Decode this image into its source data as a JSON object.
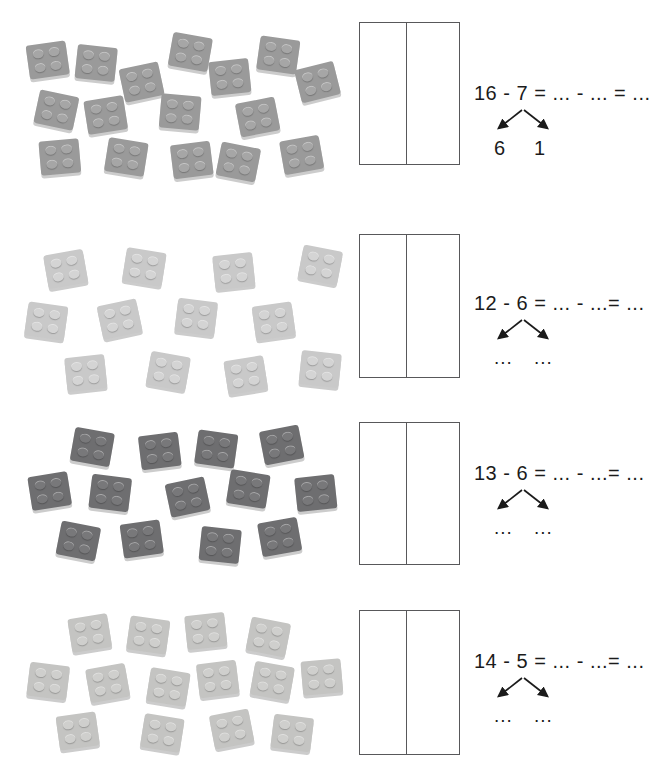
{
  "page": {
    "background_color": "#ffffff"
  },
  "rows": [
    {
      "id": "row-1",
      "brick_count": 16,
      "brick_color": "#9a9a9a",
      "brick_stud_color": "#a6a6a6",
      "equation": "16 - 7 = ... - ... = ...",
      "minuend": "16",
      "subtrahend": "7",
      "bond_left": "6",
      "bond_right": "1",
      "box_filled": false
    },
    {
      "id": "row-2",
      "brick_count": 12,
      "brick_color": "#c9c9c9",
      "brick_stud_color": "#d4d4d4",
      "equation": "12 - 6 = ... - ...= ...",
      "minuend": "12",
      "subtrahend": "6",
      "bond_left": "...",
      "bond_right": "...",
      "box_filled": false
    },
    {
      "id": "row-3",
      "brick_count": 13,
      "brick_color": "#6e6e70",
      "brick_stud_color": "#78787a",
      "equation": "13 - 6 = ... - ...= ...",
      "minuend": "13",
      "subtrahend": "6",
      "bond_left": "...",
      "bond_right": "...",
      "box_filled": false
    },
    {
      "id": "row-4",
      "brick_count": 14,
      "brick_color": "#c4c4c2",
      "brick_stud_color": "#cfcfcd",
      "equation": "14 - 5 = ... - ...= ...",
      "minuend": "14",
      "subtrahend": "5",
      "bond_left": "...",
      "bond_right": "...",
      "box_filled": false
    }
  ],
  "brick_layouts": {
    "row-1": [
      {
        "x": 28,
        "y": 33,
        "r": -8
      },
      {
        "x": 76,
        "y": 36,
        "r": 6
      },
      {
        "x": 122,
        "y": 55,
        "r": -12
      },
      {
        "x": 170,
        "y": 25,
        "r": 10
      },
      {
        "x": 210,
        "y": 50,
        "r": -6
      },
      {
        "x": 258,
        "y": 28,
        "r": 8
      },
      {
        "x": 298,
        "y": 55,
        "r": -14
      },
      {
        "x": 36,
        "y": 83,
        "r": 12
      },
      {
        "x": 86,
        "y": 88,
        "r": -9
      },
      {
        "x": 160,
        "y": 85,
        "r": 5
      },
      {
        "x": 238,
        "y": 90,
        "r": -11
      },
      {
        "x": 40,
        "y": 130,
        "r": -5
      },
      {
        "x": 106,
        "y": 130,
        "r": 9
      },
      {
        "x": 172,
        "y": 133,
        "r": -7
      },
      {
        "x": 218,
        "y": 135,
        "r": 11
      },
      {
        "x": 282,
        "y": 128,
        "r": -10
      }
    ],
    "row-2": [
      {
        "x": 46,
        "y": 30,
        "r": -10
      },
      {
        "x": 124,
        "y": 28,
        "r": 9
      },
      {
        "x": 214,
        "y": 32,
        "r": -6
      },
      {
        "x": 300,
        "y": 26,
        "r": 11
      },
      {
        "x": 26,
        "y": 82,
        "r": 8
      },
      {
        "x": 100,
        "y": 80,
        "r": -12
      },
      {
        "x": 176,
        "y": 78,
        "r": 7
      },
      {
        "x": 254,
        "y": 82,
        "r": -8
      },
      {
        "x": 66,
        "y": 134,
        "r": -6
      },
      {
        "x": 148,
        "y": 132,
        "r": 10
      },
      {
        "x": 226,
        "y": 136,
        "r": -9
      },
      {
        "x": 300,
        "y": 130,
        "r": 6
      }
    ],
    "row-3": [
      {
        "x": 72,
        "y": 20,
        "r": 10
      },
      {
        "x": 140,
        "y": 24,
        "r": -7
      },
      {
        "x": 196,
        "y": 22,
        "r": 8
      },
      {
        "x": 262,
        "y": 18,
        "r": -11
      },
      {
        "x": 30,
        "y": 64,
        "r": -9
      },
      {
        "x": 90,
        "y": 66,
        "r": 7
      },
      {
        "x": 168,
        "y": 70,
        "r": -12
      },
      {
        "x": 228,
        "y": 62,
        "r": 9
      },
      {
        "x": 296,
        "y": 66,
        "r": -6
      },
      {
        "x": 58,
        "y": 114,
        "r": 11
      },
      {
        "x": 122,
        "y": 112,
        "r": -8
      },
      {
        "x": 200,
        "y": 118,
        "r": 6
      },
      {
        "x": 260,
        "y": 110,
        "r": -10
      }
    ],
    "row-4": [
      {
        "x": 70,
        "y": 18,
        "r": -9
      },
      {
        "x": 128,
        "y": 20,
        "r": 8
      },
      {
        "x": 186,
        "y": 16,
        "r": -6
      },
      {
        "x": 248,
        "y": 22,
        "r": 11
      },
      {
        "x": 28,
        "y": 66,
        "r": 7
      },
      {
        "x": 88,
        "y": 68,
        "r": -10
      },
      {
        "x": 148,
        "y": 72,
        "r": 9
      },
      {
        "x": 198,
        "y": 64,
        "r": -7
      },
      {
        "x": 252,
        "y": 66,
        "r": 10
      },
      {
        "x": 302,
        "y": 62,
        "r": -5
      },
      {
        "x": 58,
        "y": 116,
        "r": -8
      },
      {
        "x": 142,
        "y": 118,
        "r": 9
      },
      {
        "x": 212,
        "y": 114,
        "r": -11
      },
      {
        "x": 272,
        "y": 118,
        "r": 7
      }
    ]
  },
  "boxes": [
    {
      "id": "answer-box-1",
      "left": 359,
      "top": 22,
      "width": 101,
      "height": 143,
      "divider_offset": 46
    },
    {
      "id": "answer-box-2",
      "left": 359,
      "top": 234,
      "width": 101,
      "height": 144,
      "divider_offset": 46
    },
    {
      "id": "answer-box-3",
      "left": 359,
      "top": 422,
      "width": 101,
      "height": 143,
      "divider_offset": 46
    },
    {
      "id": "answer-box-4",
      "left": 359,
      "top": 610,
      "width": 101,
      "height": 145,
      "divider_offset": 46
    }
  ],
  "row_positions": [
    {
      "top": 10,
      "eq_left": 474,
      "eq_top": 82
    },
    {
      "top": 222,
      "eq_left": 474,
      "eq_top": 292
    },
    {
      "top": 410,
      "eq_left": 474,
      "eq_top": 462
    },
    {
      "top": 598,
      "eq_left": 474,
      "eq_top": 650
    }
  ]
}
